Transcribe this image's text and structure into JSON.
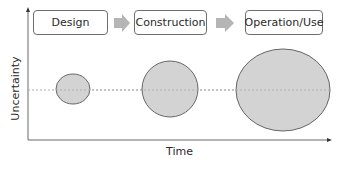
{
  "diagram": {
    "phases": [
      {
        "label": "Design"
      },
      {
        "label": "Construction"
      },
      {
        "label": "Operation/Use"
      }
    ],
    "axes": {
      "x_label": "Time",
      "y_label": "Uncertainty"
    },
    "uncertainty_ellipses": [
      {
        "phase": "Design",
        "relative_size": "small"
      },
      {
        "phase": "Construction",
        "relative_size": "medium"
      },
      {
        "phase": "Operation/Use",
        "relative_size": "large"
      }
    ],
    "colors": {
      "ellipse_fill": "#d3d3d3",
      "ellipse_stroke": "#666666",
      "arrow_fill": "#b5b5b5",
      "axis": "#6a6a6a",
      "baseline": "#b0b0b0"
    }
  }
}
